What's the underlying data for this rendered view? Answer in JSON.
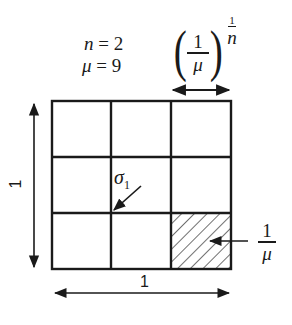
{
  "params": {
    "n_label": "n",
    "n_eq": " = 2",
    "mu_label": "μ",
    "mu_eq": " = 9"
  },
  "cell_width_label": {
    "open_paren": "(",
    "close_paren": ")",
    "numerator": "1",
    "denominator": "μ",
    "exponent_numerator": "1",
    "exponent_denominator": "n"
  },
  "grid": {
    "rows": 3,
    "cols": 3,
    "hatched_cell": {
      "row": 2,
      "col": 2
    },
    "stroke_color": "#1a1a1a"
  },
  "side_label": "1",
  "bottom_label": "1",
  "sigma_label": {
    "symbol": "σ",
    "subscript": "1"
  },
  "area_label": {
    "numerator": "1",
    "denominator": "μ"
  }
}
